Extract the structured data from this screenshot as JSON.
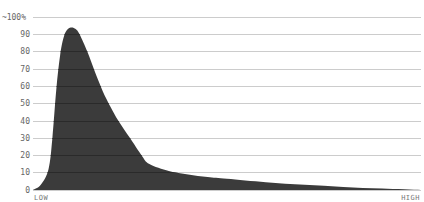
{
  "chart_data": {
    "type": "area",
    "title": "",
    "xlabel": "",
    "ylabel": "",
    "x_tick_labels": {
      "left": "LOW",
      "right": "HIGH"
    },
    "y_ticks": [
      "0",
      "10",
      "20",
      "30",
      "40",
      "50",
      "60",
      "70",
      "80",
      "90",
      "~100%"
    ],
    "ylim": [
      0,
      100
    ],
    "grid": true,
    "legend": null,
    "fill_color": "#3b3b3b",
    "grid_color": "#cccccc",
    "x": [
      0,
      2,
      4,
      5,
      6,
      7,
      8,
      9,
      10,
      11,
      12,
      14,
      16,
      18,
      20,
      22,
      25,
      28,
      30,
      35,
      40,
      45,
      50,
      60,
      70,
      80,
      90,
      100
    ],
    "values": [
      0,
      3,
      12,
      30,
      58,
      78,
      89,
      93,
      94,
      93,
      90,
      80,
      68,
      57,
      48,
      40,
      30,
      20,
      15,
      11,
      9,
      7.5,
      6.5,
      4.5,
      3,
      1.8,
      0.8,
      0
    ]
  },
  "axis": {
    "y_labels": [
      {
        "text": "~100%",
        "y": 17
      },
      {
        "text": "90",
        "y": 34
      },
      {
        "text": "80",
        "y": 51
      },
      {
        "text": "70",
        "y": 69
      },
      {
        "text": "60",
        "y": 86
      },
      {
        "text": "50",
        "y": 103
      },
      {
        "text": "40",
        "y": 121
      },
      {
        "text": "30",
        "y": 138
      },
      {
        "text": "20",
        "y": 155
      },
      {
        "text": "10",
        "y": 172
      },
      {
        "text": "0",
        "y": 190
      }
    ],
    "x_left": "LOW",
    "x_right": "HIGH"
  }
}
